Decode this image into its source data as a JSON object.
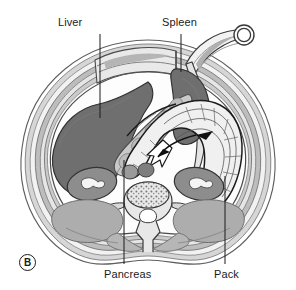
{
  "figure": {
    "panel_letter": "B",
    "type": "medical-illustration",
    "view": "abdominal cross-section",
    "background_color": "#ffffff"
  },
  "labels": [
    {
      "id": "liver",
      "text": "Liver",
      "leader_from": [
        100,
        34
      ],
      "leader_to": [
        100,
        118
      ]
    },
    {
      "id": "spleen",
      "text": "Spleen",
      "leader_from": [
        181,
        34
      ],
      "leader_to": [
        181,
        72
      ]
    },
    {
      "id": "pancreas",
      "text": "Pancreas",
      "leader_from": [
        124,
        266
      ],
      "leader_to": [
        124,
        160
      ]
    },
    {
      "id": "pack",
      "text": "Pack",
      "leader_from": [
        225,
        266
      ],
      "leader_to": [
        225,
        176
      ]
    }
  ],
  "structures": {
    "abdominal_wall": {
      "name": "abdominal wall",
      "fill": "#c9c9c9",
      "stroke": "#5e5e5e"
    },
    "liver": {
      "name": "liver",
      "fill": "#6f6f6f",
      "stroke": "#3f3f3f"
    },
    "spleen": {
      "name": "spleen",
      "fill": "#6f6f6f",
      "stroke": "#3f3f3f"
    },
    "pancreas": {
      "name": "pancreas",
      "fill": "#c4c4c4",
      "stroke": "#555555"
    },
    "pack": {
      "name": "surgical pack",
      "fill": "#ededed",
      "stroke": "#1b1b1b"
    },
    "kidney_right": {
      "name": "right kidney",
      "fill": "#8d8d8d",
      "stroke": "#3f3f3f"
    },
    "kidney_left": {
      "name": "left kidney",
      "fill": "#8d8d8d",
      "stroke": "#3f3f3f"
    },
    "vertebra": {
      "name": "vertebra",
      "fill": "#e8e8e8",
      "stroke": "#4a4a4a"
    },
    "back_muscles": {
      "name": "paraspinal muscles",
      "fill": "#a9a9a9",
      "stroke": "#6a6a6a"
    },
    "retractor_ring": {
      "name": "retractor ring",
      "fill": "#ffffff",
      "stroke": "#3a3a3a"
    }
  },
  "arrows": [
    {
      "id": "pack-direction-white",
      "style": "white-filled",
      "points_toward": "left-down"
    },
    {
      "id": "pack-direction-black",
      "style": "black-solid",
      "points_toward": "left"
    }
  ],
  "colors": {
    "line": "#1b1b1b",
    "organ_dark": "#6f6f6f",
    "organ_mid": "#8d8d8d",
    "wall_gray": "#c9c9c9",
    "muscle_gray": "#a9a9a9",
    "pack_light": "#ededed",
    "text": "#1b1b1b"
  }
}
